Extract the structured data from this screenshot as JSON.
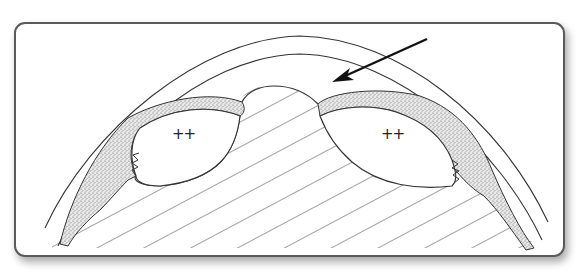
{
  "figure": {
    "type": "anatomical line drawing",
    "frame": {
      "border_color": "#555555",
      "background": "#ffffff",
      "shadow": true,
      "corner_radius": 10
    },
    "labels": [
      {
        "id": "left-region",
        "text": "++"
      },
      {
        "id": "right-region",
        "text": "++"
      }
    ],
    "arrow": {
      "direction": "down-left",
      "color": "#111111"
    },
    "colors": {
      "line": "#333333",
      "stipple": "#999999",
      "hatch": "#444444"
    }
  }
}
